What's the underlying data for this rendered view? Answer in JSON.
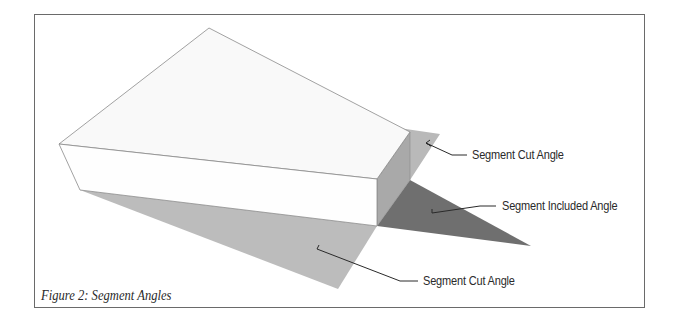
{
  "figure": {
    "caption": "Figure 2: Segment Angles",
    "labels": {
      "upper_cut_angle": "Segment Cut Angle",
      "included_angle": "Segment Included Angle",
      "lower_cut_angle": "Segment Cut Angle"
    },
    "colors": {
      "border": "#6a6a6a",
      "box_face": "#f9f9f9",
      "box_front": "#fefefe",
      "box_side": "#a9a9a9",
      "cut_angle_plane": "#bcbcbc",
      "included_angle_plane": "#6f6f6f",
      "edge": "#8a8a8a",
      "leader": "#2a2a2a"
    }
  }
}
